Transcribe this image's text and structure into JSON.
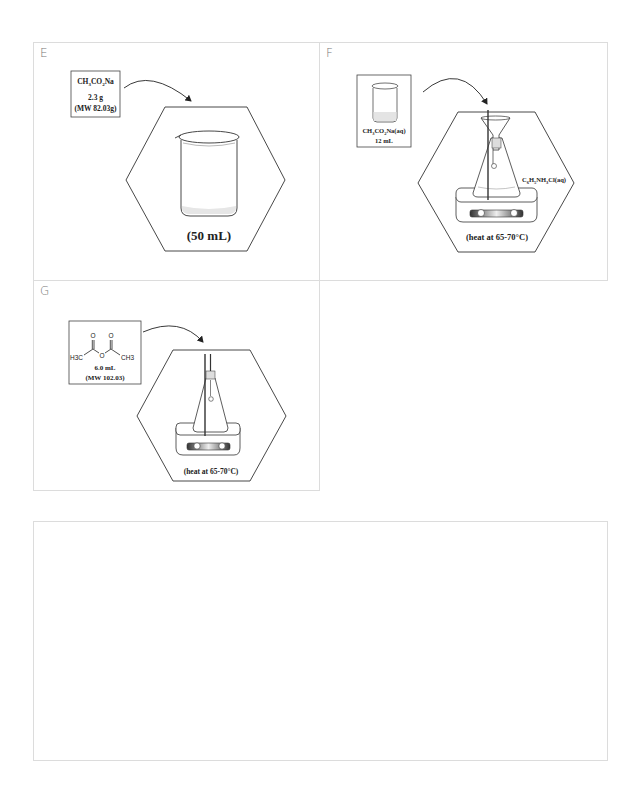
{
  "panels": [
    {
      "id": "E",
      "letter": "E",
      "reagent": {
        "formula_parts": [
          "CH",
          "3",
          "CO",
          "2",
          "Na"
        ],
        "amount": "2.3 g",
        "mw": "(MW 82.03g)"
      },
      "vessel": "beaker",
      "caption": "(50 mL)"
    },
    {
      "id": "F",
      "letter": "F",
      "reagent": {
        "formula_parts": [
          "CH",
          "3",
          "CO",
          "2",
          "Na(aq)"
        ],
        "amount": "12 mL"
      },
      "vessel": "erlenmeyer-flask-with-funnel-on-hotplate",
      "side_label_parts": [
        "C",
        "6",
        "H",
        "5",
        "NH",
        "3",
        "Cl(aq)"
      ],
      "caption": "(heat at 65-70°C)"
    },
    {
      "id": "G",
      "letter": "G",
      "reagent": {
        "structure": "acetic anhydride",
        "left_group": "H3C",
        "right_group": "CH3",
        "bridge": "O",
        "carbonyl_o": "O",
        "amount": "6.0 mL",
        "mw": "(MW 102.03)"
      },
      "vessel": "erlenmeyer-flask-on-hotplate",
      "caption": "(heat at 65-70°C)"
    },
    {
      "id": "blank",
      "letter": ""
    }
  ]
}
